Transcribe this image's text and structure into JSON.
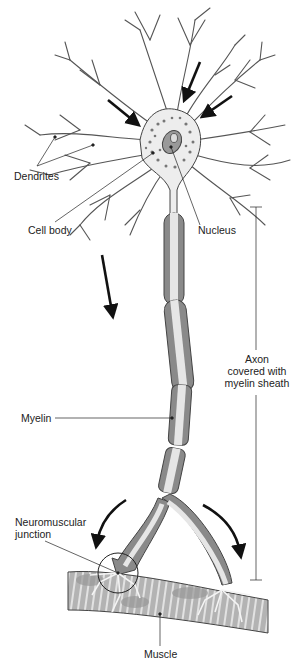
{
  "diagram": {
    "labels": {
      "dendrites": "Dendrites",
      "cell_body": "Cell body",
      "nucleus": "Nucleus",
      "axon_line1": "Axon",
      "axon_line2": "covered with",
      "axon_line3": "myelin sheath",
      "myelin": "Myelin",
      "nmj_line1": "Neuromuscular",
      "nmj_line2": "junction",
      "muscle": "Muscle"
    },
    "colors": {
      "outline": "#333333",
      "cytoplasm": "#ededed",
      "myelin_dark": "#8a8a8a",
      "myelin_light": "#bdbdbd",
      "axon_core": "#e6e6e6",
      "muscle": "#b8b8b8",
      "muscle_stripe": "#dcdcdc",
      "arrow": "#111111"
    },
    "signal_direction": "dendrites → cell body → axon → muscle"
  }
}
